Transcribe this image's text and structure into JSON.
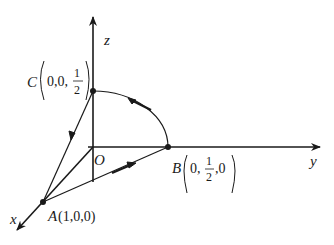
{
  "diagram": {
    "type": "3d-coordinate-path",
    "axes": {
      "x_label": "x",
      "y_label": "y",
      "z_label": "z",
      "origin_label": "O"
    },
    "points": [
      {
        "name": "A",
        "coords_text": "(1,0,0)"
      },
      {
        "name": "B",
        "coords_prefix": "0,",
        "frac_num": "1",
        "frac_den": "2",
        "coords_suffix": ",0"
      },
      {
        "name": "C",
        "coords_prefix": "0,0,",
        "frac_num": "1",
        "frac_den": "2",
        "coords_suffix": ""
      }
    ],
    "paths": [
      {
        "from": "A",
        "to": "B",
        "kind": "segment",
        "arrow": "toward B"
      },
      {
        "from": "B",
        "to": "C",
        "kind": "arc",
        "arrow": "toward C"
      },
      {
        "from": "C",
        "to": "A",
        "kind": "segment",
        "arrow": "toward A"
      }
    ]
  },
  "colors": {
    "stroke": "#1a1a1a",
    "background": "#ffffff"
  }
}
